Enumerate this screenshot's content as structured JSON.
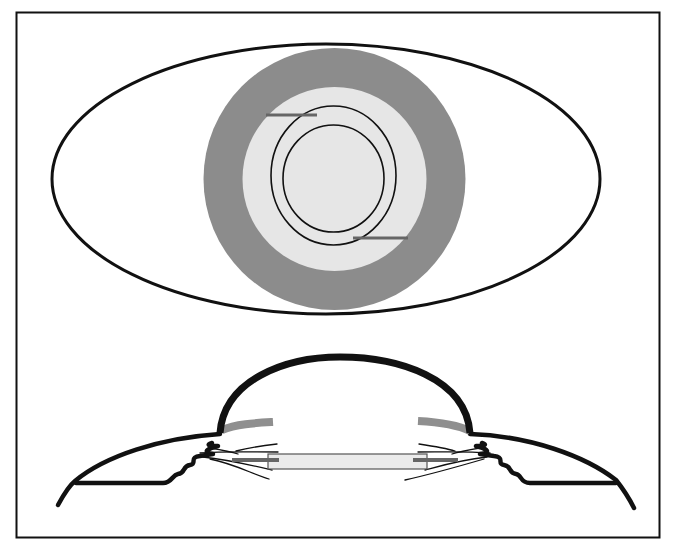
{
  "figure": {
    "width": 675,
    "height": 547,
    "background": "#ffffff",
    "frame": {
      "x": 16.5,
      "y": 12.5,
      "width": 643,
      "height": 525,
      "stroke": "#111111",
      "stroke_width": 2
    }
  },
  "colors": {
    "outline": "#111111",
    "ring_dark_gray": "#8c8c8c",
    "disk_light_gray": "#e6e6e6",
    "tab_gray": "#666666",
    "band_gray": "#8f8f8f",
    "lens_fill": "#ebebeb",
    "lens_stroke": "#555555"
  },
  "front_view": {
    "eye_outline": {
      "cx": 326,
      "cy": 179,
      "rx": 274,
      "ry": 135,
      "stroke_width": 3
    },
    "outer_gray_disk": {
      "cx": 334.5,
      "cy": 179,
      "r": 131
    },
    "inner_light_disk": {
      "cx": 334.5,
      "cy": 179,
      "r": 92
    },
    "outer_ring": {
      "cx": 333.5,
      "cy": 175.5,
      "rx": 62.5,
      "ry": 69.5,
      "stroke_width": 1.6
    },
    "inner_ring": {
      "cx": 333.5,
      "cy": 178.5,
      "rx": 50.5,
      "ry": 53.5,
      "stroke_width": 1.6
    },
    "upper_haptic_tab": {
      "x1": 266,
      "y1": 115,
      "x2": 317,
      "y2": 115,
      "stroke_width": 3
    },
    "lower_haptic_tab": {
      "x1": 353,
      "y1": 238,
      "x2": 408,
      "y2": 238,
      "stroke_width": 3
    }
  },
  "side_view": {
    "cornea_dome": {
      "d": "M 220 433 C 224 380, 285 357, 340 357 C 398 357, 466 378, 470 433",
      "stroke_width": 7
    },
    "left_iris_band": {
      "d": "M 222 430 C 236 424, 256 423, 273 422",
      "stroke_width": 8
    },
    "right_iris_band": {
      "d": "M 418 421 C 436 422, 456 424, 470 431",
      "stroke_width": 8
    },
    "left_sclera": {
      "d": "M 58 505 C 65 492, 70 485, 75 481 C 105 456, 160 438, 220 434",
      "stroke_width": 4.5
    },
    "left_base": {
      "d": "M 76 483 L 163 483 C 172 483, 172 475, 178 474 C 186 473, 182 466, 190 465 C 198 464, 188 457, 200 456 L 213 454 C 200 452, 210 448, 218 446 C 210 446, 205 445, 212 443",
      "stroke_width": 4.5
    },
    "right_sclera": {
      "d": "M 470 434 C 530 436, 585 456, 616 480 C 624 490, 630 500, 634 508",
      "stroke_width": 4.5
    },
    "right_base": {
      "d": "M 616 483 L 530 483 C 520 483, 522 475, 516 474 C 508 473, 512 466, 504 465 C 496 464, 506 457, 494 456 L 480 454 C 494 452, 484 448, 476 446 C 484 446, 488 445, 482 443",
      "stroke_width": 4.5
    },
    "lens_optic": {
      "x": 268,
      "y": 454,
      "width": 159,
      "height": 15,
      "stroke_width": 1.2
    },
    "left_haptic_bar": {
      "x1": 232,
      "y1": 460,
      "x2": 279,
      "y2": 460,
      "stroke_width": 4
    },
    "right_haptic_bar": {
      "x1": 413,
      "y1": 460,
      "x2": 458,
      "y2": 460,
      "stroke_width": 4
    },
    "left_capsule_lines": [
      "M 200 453 C 225 451, 250 452, 278 452",
      "M 203 457 C 230 460, 255 466, 272 470",
      "M 210 459 C 235 464, 252 474, 269 479",
      "M 210 448 C 222 450, 232 452, 238 454",
      "M 236 451 C 248 448, 260 446, 277 444"
    ],
    "right_capsule_lines": [
      "M 490 453 C 465 451, 440 452, 418 452",
      "M 487 457 C 460 460, 440 466, 425 470",
      "M 484 459 C 460 466, 432 474, 405 480",
      "M 480 448 C 468 450, 458 452, 452 454",
      "M 455 451 C 445 448, 432 446, 419 444"
    ],
    "capsule_line_width": 1.3
  }
}
